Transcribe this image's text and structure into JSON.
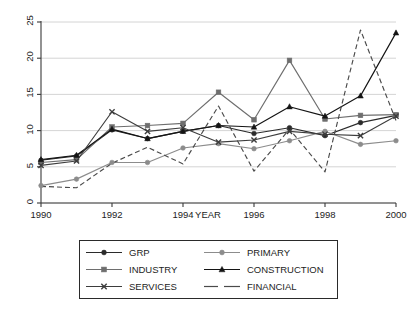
{
  "chart_data": {
    "type": "line",
    "title": "",
    "subtitle": "",
    "xlabel": "YEAR",
    "ylabel": "",
    "x": [
      1990,
      1991,
      1992,
      1993,
      1994,
      1995,
      1996,
      1997,
      1998,
      1999,
      2000
    ],
    "xtick_labels": [
      "1990",
      "1992",
      "1994",
      "1996",
      "1998",
      "2000"
    ],
    "xtick_values": [
      1990,
      1992,
      1994,
      1996,
      1998,
      2000
    ],
    "ytick_labels": [
      "0",
      "5",
      "10",
      "15",
      "20",
      "25"
    ],
    "ytick_values": [
      0,
      5,
      10,
      15,
      20,
      25
    ],
    "xlim": [
      1990,
      2000
    ],
    "ylim": [
      0,
      25
    ],
    "grid": "horizontal",
    "legend_position": "bottom-outside",
    "legend_columns": 2,
    "series": [
      {
        "name": "GRP",
        "marker": "circle",
        "color": "#2b2b2b",
        "dash": "solid",
        "values": [
          5.9,
          6.5,
          10.1,
          8.9,
          9.9,
          10.7,
          9.6,
          10.4,
          9.3,
          11.1,
          12.1
        ]
      },
      {
        "name": "PRIMARY",
        "marker": "circle",
        "color": "#8c8c8c",
        "dash": "solid",
        "values": [
          2.4,
          3.3,
          5.6,
          5.6,
          7.6,
          8.2,
          7.5,
          8.6,
          9.9,
          8.1,
          8.6
        ]
      },
      {
        "name": "INDUSTRY",
        "marker": "square",
        "color": "#6e6e6e",
        "dash": "solid",
        "values": [
          5.6,
          6.0,
          10.5,
          10.7,
          11.0,
          15.3,
          11.5,
          19.7,
          11.6,
          12.1,
          12.2
        ]
      },
      {
        "name": "CONSTRUCTION",
        "marker": "triangle",
        "color": "#141414",
        "dash": "solid",
        "values": [
          6.0,
          6.6,
          10.2,
          8.9,
          9.9,
          10.7,
          10.5,
          13.3,
          12.0,
          14.8,
          23.5
        ]
      },
      {
        "name": "SERVICES",
        "marker": "cross",
        "color": "#3d3d3d",
        "dash": "solid",
        "values": [
          5.2,
          5.8,
          12.6,
          9.9,
          10.4,
          8.4,
          8.7,
          9.9,
          9.5,
          9.3,
          12.0
        ]
      },
      {
        "name": "FINANCIAL",
        "marker": "none",
        "color": "#4a4a4a",
        "dash": "dashed",
        "values": [
          2.3,
          2.1,
          5.5,
          7.7,
          5.4,
          13.4,
          4.4,
          10.2,
          4.3,
          23.9,
          11.4
        ]
      }
    ]
  },
  "axes": {
    "x_axis_title": "YEAR"
  },
  "legend": {
    "items": [
      {
        "label": "GRP",
        "marker": "circle-black"
      },
      {
        "label": "PRIMARY",
        "marker": "circle-gray"
      },
      {
        "label": "INDUSTRY",
        "marker": "square-gray"
      },
      {
        "label": "CONSTRUCTION",
        "marker": "triangle-black"
      },
      {
        "label": "SERVICES",
        "marker": "cross-black"
      },
      {
        "label": "FINANCIAL",
        "marker": "dashed-line"
      }
    ]
  },
  "colors": {
    "grp": "#2b2b2b",
    "primary": "#8c8c8c",
    "industry": "#6e6e6e",
    "construction": "#141414",
    "services": "#3d3d3d",
    "financial": "#4a4a4a",
    "grid": "#c9c9c9",
    "axis": "#3a3a3a",
    "background": "#ffffff"
  }
}
